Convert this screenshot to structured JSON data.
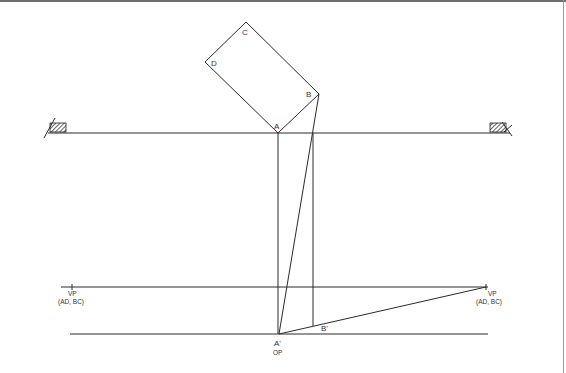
{
  "diagram": {
    "type": "perspective-plan-construction",
    "labels": {
      "corner_a": "A",
      "corner_b": "B",
      "corner_c": "C",
      "corner_d": "D",
      "a_prime": "A'",
      "b_prime": "B'",
      "op": "OP",
      "vp_left": "VP",
      "vp_left_sub": "(AD, BC)",
      "vp_right": "VP",
      "vp_right_sub": "(AD, BC)"
    },
    "colors": {
      "line": "#2a2a2a",
      "text": "#333333",
      "background": "#ffffff",
      "frame_top": "#6e6e6e"
    }
  }
}
